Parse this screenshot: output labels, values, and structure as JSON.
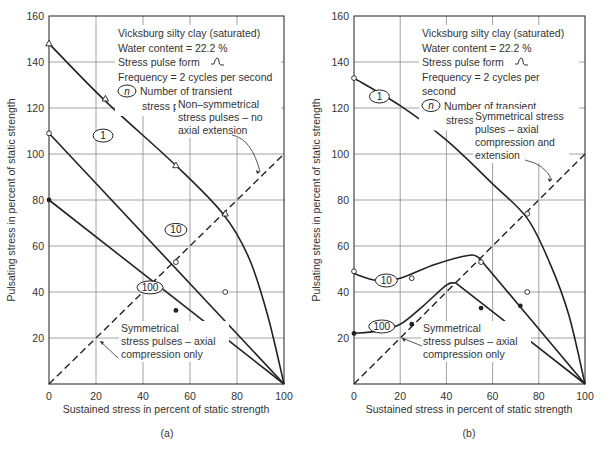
{
  "chart_data": [
    {
      "panel": "(a)",
      "type": "line",
      "title": "",
      "caption": "(a)",
      "xlabel": "Sustained stress in percent of static strength",
      "ylabel": "Pulsating stress in percent of static strength",
      "xlim": [
        0,
        100
      ],
      "ylim": [
        0,
        160
      ],
      "xticks": [
        "0",
        "20",
        "40",
        "60",
        "80",
        "100"
      ],
      "yticks": [
        "20",
        "40",
        "60",
        "80",
        "100",
        "120",
        "140",
        "160"
      ],
      "grid": true,
      "legend_notes": [
        "Vicksburg silty clay (saturated)",
        "Water content = 22.2 %",
        "Stress pulse form",
        "Frequency = 2 cycles per second",
        "Number of transient",
        "stress pulses"
      ],
      "legend_symbol": "n",
      "series": [
        {
          "name": "1",
          "label": "1",
          "x": [
            0,
            23,
            54,
            74,
            85,
            93,
            100
          ],
          "y": [
            148,
            124,
            95,
            74,
            55,
            30,
            0
          ],
          "markers": "triangle-open",
          "marker_points": [
            [
              0,
              148
            ],
            [
              24,
              124
            ],
            [
              54,
              95
            ],
            [
              75,
              74
            ]
          ]
        },
        {
          "name": "10",
          "label": "10",
          "x": [
            0,
            100
          ],
          "y": [
            109,
            0
          ],
          "markers": "circle-open",
          "marker_points": [
            [
              0,
              109
            ],
            [
              54,
              53
            ],
            [
              75,
              40
            ]
          ]
        },
        {
          "name": "100",
          "label": "100",
          "x": [
            0,
            100
          ],
          "y": [
            80,
            0
          ],
          "markers": "circle-filled",
          "marker_points": [
            [
              0,
              80
            ],
            [
              54,
              32
            ],
            [
              74,
              24
            ]
          ]
        }
      ],
      "reference_line": {
        "label": "Non-symmetrical stress pulses – no axial extension",
        "x": [
          0,
          100
        ],
        "y": [
          0,
          100
        ],
        "style": "dashed"
      },
      "annotations": [
        {
          "text": [
            "Non–symmetrical",
            "stress pulses – no",
            "axial extension"
          ]
        },
        {
          "text": [
            "Symmetrical",
            "stress pulses – axial",
            "compression only"
          ]
        }
      ]
    },
    {
      "panel": "(b)",
      "type": "line",
      "title": "",
      "caption": "(b)",
      "xlabel": "Sustained stress in percent of static strength",
      "ylabel": "Pulsating stress in percent of static strength",
      "xlim": [
        0,
        100
      ],
      "ylim": [
        0,
        160
      ],
      "xticks": [
        "0",
        "20",
        "40",
        "60",
        "80",
        "100"
      ],
      "yticks": [
        "20",
        "40",
        "60",
        "80",
        "100",
        "120",
        "140",
        "160"
      ],
      "grid": true,
      "legend_notes": [
        "Vicksburg silty clay (saturated)",
        "Water content = 22.2 %",
        "Stress pulse form",
        "Frequency = 2 cycles per",
        "second",
        "Number of transient",
        "stress pulses"
      ],
      "legend_symbol": "n",
      "series": [
        {
          "name": "1",
          "label": "1",
          "x": [
            0,
            20,
            40,
            60,
            75,
            85,
            93,
            100
          ],
          "y": [
            133,
            121,
            106,
            87,
            72,
            52,
            30,
            0
          ],
          "markers": "circle-open",
          "marker_points": [
            [
              0,
              133
            ],
            [
              75,
              74
            ]
          ]
        },
        {
          "name": "10",
          "label": "10",
          "x": [
            0,
            10,
            20,
            35,
            50,
            54,
            100
          ],
          "y": [
            48,
            45,
            46,
            52,
            56,
            55,
            0
          ],
          "markers": "circle-open",
          "marker_points": [
            [
              0,
              49
            ],
            [
              25,
              46
            ],
            [
              55,
              53
            ],
            [
              75,
              40
            ]
          ]
        },
        {
          "name": "100",
          "label": "100",
          "x": [
            0,
            10,
            20,
            30,
            40,
            44,
            100
          ],
          "y": [
            22,
            23,
            26,
            34,
            43,
            44,
            0
          ],
          "markers": "circle-filled",
          "marker_points": [
            [
              0,
              22
            ],
            [
              25,
              26
            ],
            [
              55,
              33
            ],
            [
              72,
              34
            ],
            [
              75,
              24
            ]
          ]
        }
      ],
      "reference_line": {
        "label": "Symmetrical stress pulses – axial compression and extension",
        "x": [
          0,
          100
        ],
        "y": [
          0,
          100
        ],
        "style": "dashed"
      },
      "annotations": [
        {
          "text": [
            "Symmetrical stress",
            "pulses – axial",
            "compression and",
            "extension"
          ]
        },
        {
          "text": [
            "Symmetrical",
            "stress pulses – axial",
            "compression only"
          ]
        }
      ]
    }
  ]
}
